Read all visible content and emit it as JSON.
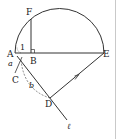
{
  "figure": {
    "points": {
      "A": "A",
      "B": "B",
      "C": "C",
      "D": "D",
      "E": "E",
      "F": "F"
    },
    "labels": {
      "angle1": "1",
      "a": "a",
      "b": "b",
      "line": "ℓ"
    },
    "colors": {
      "stroke": "#333333",
      "background": "#ffffff"
    }
  }
}
